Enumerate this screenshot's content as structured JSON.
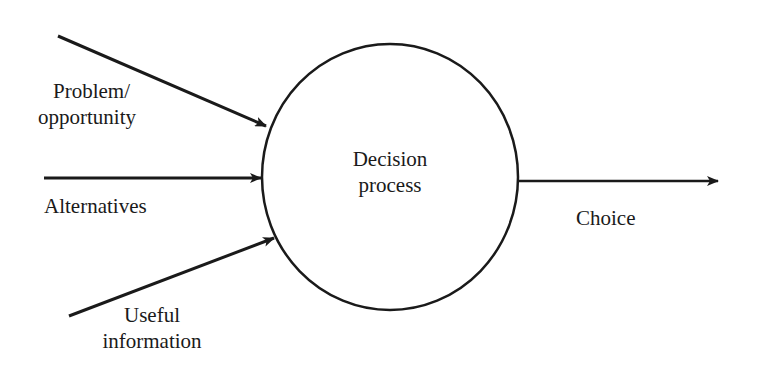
{
  "diagram": {
    "type": "process-flow",
    "process": {
      "label_line1": "Decision",
      "label_line2": "process"
    },
    "inputs": [
      {
        "label_line1": "Problem/",
        "label_line2": "opportunity"
      },
      {
        "label_line1": "Alternatives"
      },
      {
        "label_line1": "Useful",
        "label_line2": "information"
      }
    ],
    "output": {
      "label_line1": "Choice"
    },
    "colors": {
      "stroke": "#1a1a1a",
      "background": "#ffffff"
    }
  }
}
